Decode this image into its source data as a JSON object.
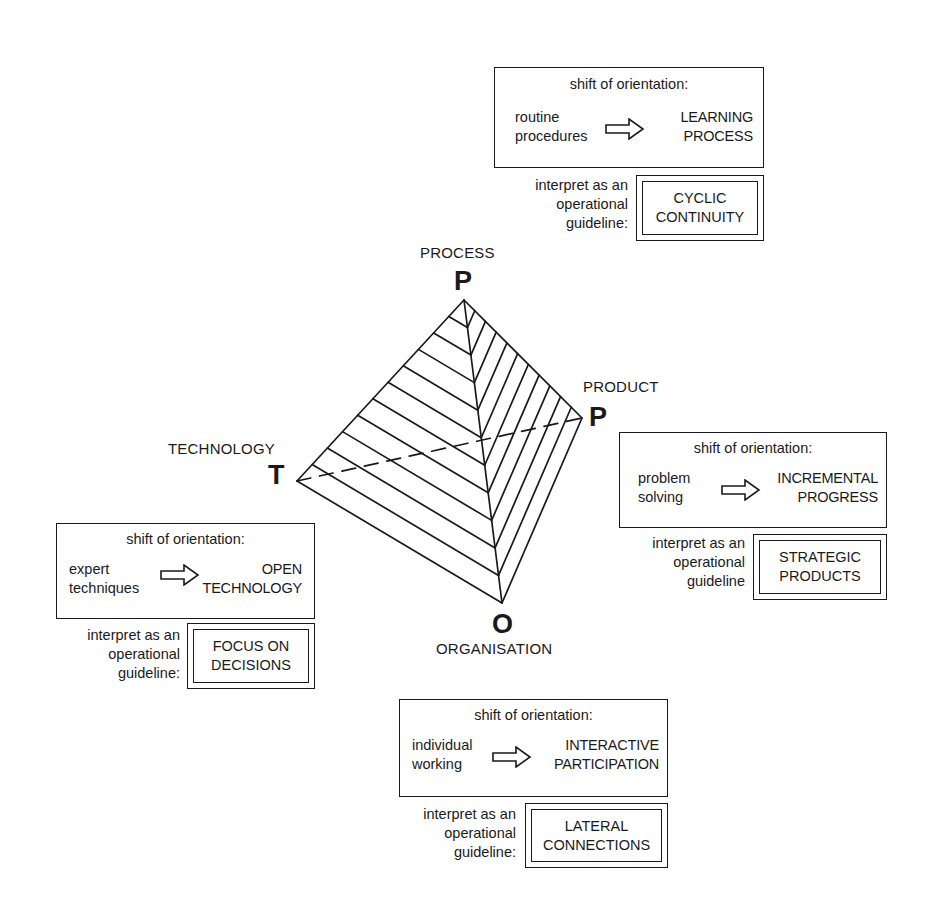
{
  "diagram": {
    "type": "tetrahedral-pyramid",
    "vertices": [
      {
        "id": "process",
        "name": "PROCESS",
        "letter": "P"
      },
      {
        "id": "product",
        "name": "PRODUCT",
        "letter": "P"
      },
      {
        "id": "technology",
        "name": "TECHNOLOGY",
        "letter": "T"
      },
      {
        "id": "organisation",
        "name": "ORGANISATION",
        "letter": "O"
      }
    ]
  },
  "panels": {
    "process": {
      "shift_title": "shift of orientation:",
      "from_line1": "routine",
      "from_line2": "procedures",
      "to_line1": "LEARNING",
      "to_line2": "PROCESS",
      "guide_line1": "interpret as an",
      "guide_line2": "operational",
      "guide_line3": "guideline:",
      "guideline_line1": "CYCLIC",
      "guideline_line2": "CONTINUITY"
    },
    "product": {
      "shift_title": "shift of orientation:",
      "from_line1": "problem",
      "from_line2": "solving",
      "to_line1": "INCREMENTAL",
      "to_line2": "PROGRESS",
      "guide_line1": "interpret as an",
      "guide_line2": "operational",
      "guide_line3": "guideline",
      "guideline_line1": "STRATEGIC",
      "guideline_line2": "PRODUCTS"
    },
    "technology": {
      "shift_title": "shift of orientation:",
      "from_line1": "expert",
      "from_line2": "techniques",
      "to_line1": "OPEN",
      "to_line2": "TECHNOLOGY",
      "guide_line1": "interpret as an",
      "guide_line2": "operational",
      "guide_line3": "guideline:",
      "guideline_line1": "FOCUS ON",
      "guideline_line2": "DECISIONS"
    },
    "organisation": {
      "shift_title": "shift of orientation:",
      "from_line1": "individual",
      "from_line2": "working",
      "to_line1": "INTERACTIVE",
      "to_line2": "PARTICIPATION",
      "guide_line1": "interpret as an",
      "guide_line2": "operational",
      "guide_line3": "guideline:",
      "guideline_line1": "LATERAL",
      "guideline_line2": "CONNECTIONS"
    }
  },
  "icons": {
    "shift_arrow": "outlined-right-arrow"
  },
  "colors": {
    "ink": "#1a1a1a",
    "background": "#ffffff"
  }
}
